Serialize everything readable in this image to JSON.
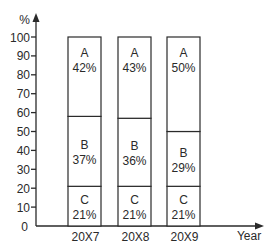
{
  "chart_data": {
    "type": "bar",
    "stacked": true,
    "title": "",
    "xlabel": "Year",
    "ylabel": "%",
    "ylim": [
      0,
      100
    ],
    "yticks": [
      0,
      10,
      20,
      30,
      40,
      50,
      60,
      70,
      80,
      90,
      100
    ],
    "grid": false,
    "legend": null,
    "categories": [
      "20X7",
      "20X8",
      "20X9"
    ],
    "series": [
      {
        "name": "C",
        "values": [
          21,
          21,
          21
        ]
      },
      {
        "name": "B",
        "values": [
          37,
          36,
          29
        ]
      },
      {
        "name": "A",
        "values": [
          42,
          43,
          50
        ]
      }
    ],
    "segment_labels": [
      [
        {
          "name": "C",
          "label": "21%"
        },
        {
          "name": "B",
          "label": "37%"
        },
        {
          "name": "A",
          "label": "42%"
        }
      ],
      [
        {
          "name": "C",
          "label": "21%"
        },
        {
          "name": "B",
          "label": "36%"
        },
        {
          "name": "A",
          "label": "43%"
        }
      ],
      [
        {
          "name": "C",
          "label": "21%"
        },
        {
          "name": "B",
          "label": "29%"
        },
        {
          "name": "A",
          "label": "50%"
        }
      ]
    ]
  },
  "colors": {
    "ink": "#2a2a2a",
    "bar_fill": "#ffffff",
    "background": "#ffffff"
  }
}
